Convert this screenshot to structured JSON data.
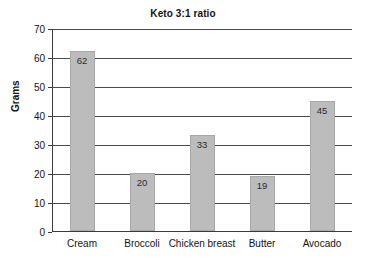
{
  "chart_data": {
    "type": "bar",
    "title": "Keto 3:1 ratio",
    "xlabel": "",
    "ylabel": "Grams",
    "categories": [
      "Cream",
      "Broccoli",
      "Chicken breast",
      "Butter",
      "Avocado"
    ],
    "values": [
      62,
      20,
      33,
      19,
      45
    ],
    "ylim": [
      0,
      70
    ],
    "yticks": [
      0,
      10,
      20,
      30,
      40,
      50,
      60,
      70
    ],
    "ytick_labels": [
      "0",
      "10",
      "20",
      "30",
      "40",
      "50",
      "60",
      "70"
    ],
    "grid": "horizontal",
    "legend": "none",
    "bar_color": "#bcbcbc",
    "bar_border_color": "#a8a8a8",
    "axis_color": "#3b3b3b",
    "background": "#ffffff",
    "value_labels": [
      "62",
      "20",
      "33",
      "19",
      "45"
    ]
  }
}
